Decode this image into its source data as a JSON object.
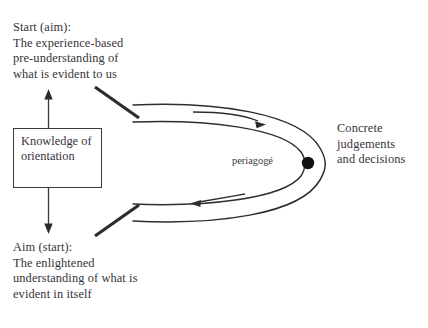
{
  "diagram": {
    "title_text_top": "Start (aim):\nThe experience-based\npre-understanding of\nwhat is evident to us",
    "text_bottom": "Aim (start):\nThe enlightened\nunderstanding of what is\nevident in itself",
    "text_right": "Concrete\njudgements\nand decisions",
    "box_label": "Knowledge of\norientation",
    "loop_label": "periagogé",
    "colors": {
      "ink": "#37343a",
      "stroke": "#3a3a3a",
      "background": "#ffffff",
      "node_dot": "#111111"
    },
    "nodes": {
      "dot_name": "periagoge-node",
      "dot_x": 308,
      "dot_y": 163
    },
    "arrows": [
      {
        "name": "arrow-up-to-start",
        "direction": "up"
      },
      {
        "name": "arrow-down-to-aim",
        "direction": "down"
      },
      {
        "name": "arrow-loop-forward",
        "direction": "right"
      },
      {
        "name": "arrow-loop-return",
        "direction": "left"
      }
    ]
  }
}
